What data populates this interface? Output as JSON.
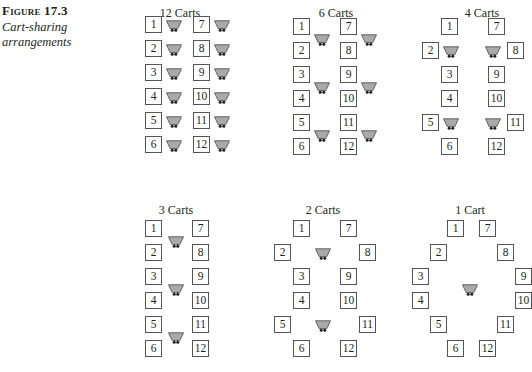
{
  "figure": {
    "label": "Figure 17.3",
    "caption": "Cart-sharing arrangements"
  },
  "colors": {
    "cart_fill": "#a9a9a9",
    "cart_stroke": "#555555",
    "box_border": "#555555",
    "text": "#231f20"
  },
  "panels": [
    {
      "title": "12 Carts",
      "title_pos": [
        180,
        6
      ],
      "boxes": [
        {
          "n": "1",
          "x": 145,
          "y": 16
        },
        {
          "n": "2",
          "x": 145,
          "y": 40
        },
        {
          "n": "3",
          "x": 145,
          "y": 64
        },
        {
          "n": "4",
          "x": 145,
          "y": 88
        },
        {
          "n": "5",
          "x": 145,
          "y": 112
        },
        {
          "n": "6",
          "x": 145,
          "y": 136
        },
        {
          "n": "7",
          "x": 193,
          "y": 16
        },
        {
          "n": "8",
          "x": 193,
          "y": 40
        },
        {
          "n": "9",
          "x": 193,
          "y": 64
        },
        {
          "n": "10",
          "x": 193,
          "y": 88
        },
        {
          "n": "11",
          "x": 193,
          "y": 112
        },
        {
          "n": "12",
          "x": 193,
          "y": 136
        }
      ],
      "carts": [
        {
          "x": 166,
          "y": 18
        },
        {
          "x": 166,
          "y": 42
        },
        {
          "x": 166,
          "y": 66
        },
        {
          "x": 166,
          "y": 90
        },
        {
          "x": 166,
          "y": 114
        },
        {
          "x": 166,
          "y": 138
        },
        {
          "x": 214,
          "y": 18
        },
        {
          "x": 214,
          "y": 42
        },
        {
          "x": 214,
          "y": 66
        },
        {
          "x": 214,
          "y": 90
        },
        {
          "x": 214,
          "y": 114
        },
        {
          "x": 214,
          "y": 138
        }
      ]
    },
    {
      "title": "6 Carts",
      "title_pos": [
        336,
        6
      ],
      "boxes": [
        {
          "n": "1",
          "x": 293,
          "y": 18
        },
        {
          "n": "2",
          "x": 293,
          "y": 42
        },
        {
          "n": "3",
          "x": 293,
          "y": 66
        },
        {
          "n": "4",
          "x": 293,
          "y": 90
        },
        {
          "n": "5",
          "x": 293,
          "y": 114
        },
        {
          "n": "6",
          "x": 293,
          "y": 138
        },
        {
          "n": "7",
          "x": 340,
          "y": 18
        },
        {
          "n": "8",
          "x": 340,
          "y": 42
        },
        {
          "n": "9",
          "x": 340,
          "y": 66
        },
        {
          "n": "10",
          "x": 340,
          "y": 90
        },
        {
          "n": "11",
          "x": 340,
          "y": 114
        },
        {
          "n": "12",
          "x": 340,
          "y": 138
        }
      ],
      "carts": [
        {
          "x": 314,
          "y": 32
        },
        {
          "x": 314,
          "y": 80
        },
        {
          "x": 314,
          "y": 128
        },
        {
          "x": 361,
          "y": 32
        },
        {
          "x": 361,
          "y": 80
        },
        {
          "x": 361,
          "y": 128
        }
      ]
    },
    {
      "title": "4 Carts",
      "title_pos": [
        482,
        6
      ],
      "boxes": [
        {
          "n": "1",
          "x": 441,
          "y": 18
        },
        {
          "n": "2",
          "x": 422,
          "y": 42
        },
        {
          "n": "3",
          "x": 441,
          "y": 66
        },
        {
          "n": "4",
          "x": 441,
          "y": 90
        },
        {
          "n": "5",
          "x": 422,
          "y": 114
        },
        {
          "n": "6",
          "x": 441,
          "y": 138
        },
        {
          "n": "7",
          "x": 488,
          "y": 18
        },
        {
          "n": "8",
          "x": 507,
          "y": 42
        },
        {
          "n": "9",
          "x": 488,
          "y": 66
        },
        {
          "n": "10",
          "x": 488,
          "y": 90
        },
        {
          "n": "11",
          "x": 507,
          "y": 114
        },
        {
          "n": "12",
          "x": 488,
          "y": 138
        }
      ],
      "carts": [
        {
          "x": 443,
          "y": 44
        },
        {
          "x": 443,
          "y": 116
        },
        {
          "x": 485,
          "y": 44
        },
        {
          "x": 485,
          "y": 116
        }
      ]
    },
    {
      "title": "3 Carts",
      "title_pos": [
        176,
        203
      ],
      "boxes": [
        {
          "n": "1",
          "x": 145,
          "y": 220
        },
        {
          "n": "2",
          "x": 145,
          "y": 244
        },
        {
          "n": "3",
          "x": 145,
          "y": 268
        },
        {
          "n": "4",
          "x": 145,
          "y": 292
        },
        {
          "n": "5",
          "x": 145,
          "y": 316
        },
        {
          "n": "6",
          "x": 145,
          "y": 340
        },
        {
          "n": "7",
          "x": 192,
          "y": 220
        },
        {
          "n": "8",
          "x": 192,
          "y": 244
        },
        {
          "n": "9",
          "x": 192,
          "y": 268
        },
        {
          "n": "10",
          "x": 192,
          "y": 292
        },
        {
          "n": "11",
          "x": 192,
          "y": 316
        },
        {
          "n": "12",
          "x": 192,
          "y": 340
        }
      ],
      "carts": [
        {
          "x": 168,
          "y": 234
        },
        {
          "x": 168,
          "y": 282
        },
        {
          "x": 168,
          "y": 330
        }
      ]
    },
    {
      "title": "2 Carts",
      "title_pos": [
        323,
        203
      ],
      "boxes": [
        {
          "n": "1",
          "x": 293,
          "y": 220
        },
        {
          "n": "2",
          "x": 274,
          "y": 244
        },
        {
          "n": "3",
          "x": 293,
          "y": 268
        },
        {
          "n": "4",
          "x": 293,
          "y": 292
        },
        {
          "n": "5",
          "x": 274,
          "y": 316
        },
        {
          "n": "6",
          "x": 293,
          "y": 340
        },
        {
          "n": "7",
          "x": 340,
          "y": 220
        },
        {
          "n": "8",
          "x": 359,
          "y": 244
        },
        {
          "n": "9",
          "x": 340,
          "y": 268
        },
        {
          "n": "10",
          "x": 340,
          "y": 292
        },
        {
          "n": "11",
          "x": 359,
          "y": 316
        },
        {
          "n": "12",
          "x": 340,
          "y": 340
        }
      ],
      "carts": [
        {
          "x": 315,
          "y": 246
        },
        {
          "x": 315,
          "y": 318
        }
      ]
    },
    {
      "title": "1 Cart",
      "title_pos": [
        470,
        203
      ],
      "boxes": [
        {
          "n": "1",
          "x": 447,
          "y": 220
        },
        {
          "n": "2",
          "x": 430,
          "y": 244
        },
        {
          "n": "3",
          "x": 412,
          "y": 268
        },
        {
          "n": "4",
          "x": 412,
          "y": 292
        },
        {
          "n": "5",
          "x": 430,
          "y": 316
        },
        {
          "n": "6",
          "x": 447,
          "y": 340
        },
        {
          "n": "7",
          "x": 479,
          "y": 220
        },
        {
          "n": "8",
          "x": 497,
          "y": 244
        },
        {
          "n": "9",
          "x": 515,
          "y": 268
        },
        {
          "n": "10",
          "x": 515,
          "y": 292
        },
        {
          "n": "11",
          "x": 497,
          "y": 316
        },
        {
          "n": "12",
          "x": 479,
          "y": 340
        }
      ],
      "carts": [
        {
          "x": 462,
          "y": 282
        }
      ]
    }
  ]
}
